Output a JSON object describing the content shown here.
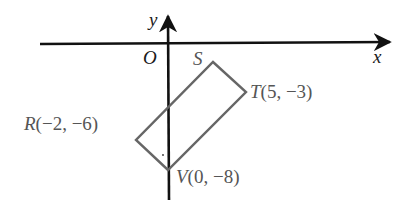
{
  "diagram": {
    "type": "coordinate-plane",
    "axes": {
      "x_label": "x",
      "y_label": "y",
      "origin_label": "O"
    },
    "shape": "rectangle",
    "vertices": [
      {
        "name": "S",
        "label": "S",
        "coords_text": ""
      },
      {
        "name": "T",
        "label": "T",
        "coords_text": "(5, −3)"
      },
      {
        "name": "V",
        "label": "V",
        "coords_text": "(0, −8)"
      },
      {
        "name": "R",
        "label": "R",
        "coords_text": "(−2, −6)"
      }
    ],
    "colors": {
      "axis": "#111111",
      "shape": "#666666",
      "label": "#555555"
    }
  }
}
